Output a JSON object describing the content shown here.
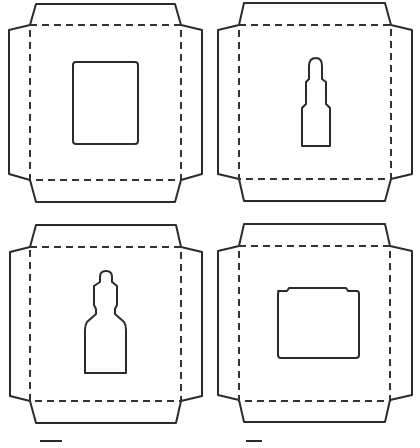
{
  "diagram": {
    "type": "packaging dielines",
    "line_styles": {
      "cut_line": "solid",
      "fold_line": "dashed",
      "cut_color": "#2b2b2b",
      "fold_color": "#333333"
    },
    "panels": [
      {
        "id": "panel-1",
        "position": "top-left",
        "window_shape": "rectangle"
      },
      {
        "id": "panel-2",
        "position": "top-right",
        "window_shape": "dropper-vial"
      },
      {
        "id": "panel-3",
        "position": "bottom-left",
        "window_shape": "dropper-bottle"
      },
      {
        "id": "panel-4",
        "position": "bottom-right",
        "window_shape": "jar-square"
      }
    ]
  }
}
